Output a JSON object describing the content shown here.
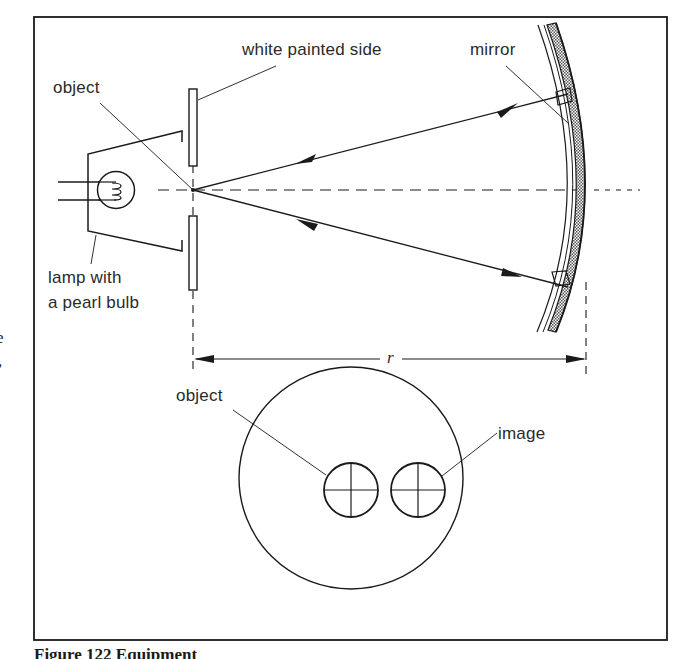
{
  "figure": {
    "caption": "Figure 122 Equipment",
    "edge_fragments": [
      "e",
      ","
    ]
  },
  "labels": {
    "white_painted_side": "white painted side",
    "mirror": "mirror",
    "object_top": "object",
    "lamp_line1": "lamp with",
    "lamp_line2": "a pearl bulb",
    "radius": "r",
    "object_bottom": "object",
    "image": "image"
  },
  "components": {
    "lamp": "lamp housing with pearl bulb",
    "plates": "white painted plates with slit",
    "optical_axis": "dashed principal axis",
    "mirror": "concave mirror (radius r)",
    "rays": "incident and reflected rays normal to mirror",
    "dimension": "radius of curvature r",
    "screen_view": "front view showing object and image side by side"
  },
  "colors": {
    "ink": "#1a1a1a",
    "background": "#ffffff",
    "mirror_hatch": "#7a7a7a"
  }
}
